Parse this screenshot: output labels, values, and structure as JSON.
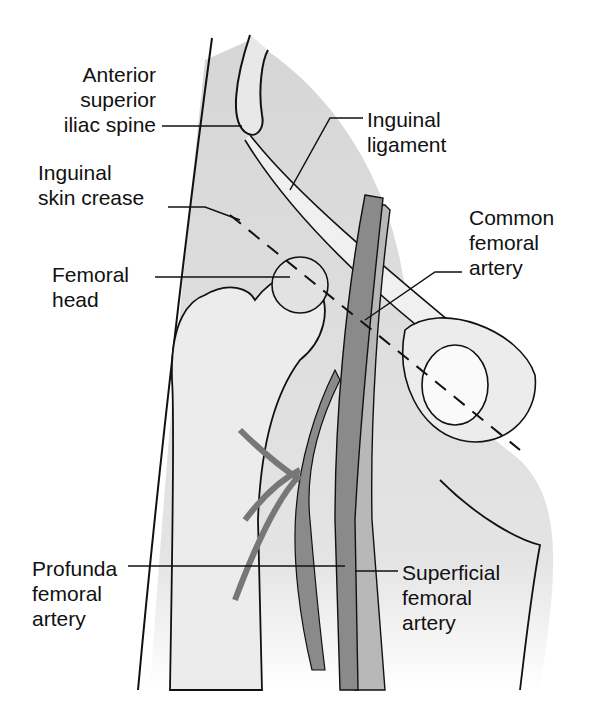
{
  "figure": {
    "labels": {
      "asis": [
        "Anterior",
        "superior",
        "iliac spine"
      ],
      "inguinal_ligament": [
        "Inguinal",
        "ligament"
      ],
      "skin_crease": [
        "Inguinal",
        "skin crease"
      ],
      "femoral_head": [
        "Femoral",
        "head"
      ],
      "common_femoral": [
        "Common",
        "femoral",
        "artery"
      ],
      "profunda": [
        "Profunda",
        "femoral",
        "artery"
      ],
      "superficial": [
        "Superficial",
        "femoral",
        "artery"
      ]
    },
    "colors": {
      "background": "#ffffff",
      "shading": "#dcdcdc",
      "artery": "#8a8a8a",
      "ink": "#111111"
    }
  }
}
